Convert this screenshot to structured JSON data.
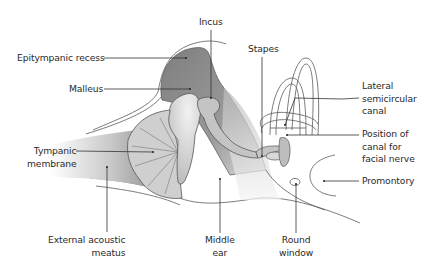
{
  "diagram": {
    "labels": {
      "incus": "Incus",
      "epitympanic_recess": "Epitympanic recess",
      "stapes": "Stapes",
      "malleus": "Malleus",
      "lateral_semicircular_canal": [
        "Lateral",
        "semicircular",
        "canal"
      ],
      "facial_nerve_canal": [
        "Position of",
        "canal for",
        "facial nerve"
      ],
      "tympanic_membrane": [
        "Tympanic",
        "membrane"
      ],
      "promontory": "Promontory",
      "external_acoustic_meatus": [
        "External acoustic",
        "meatus"
      ],
      "middle_ear": [
        "Middle",
        "ear"
      ],
      "round_window": [
        "Round",
        "window"
      ]
    },
    "colors": {
      "outline": "#4a4a4a",
      "leader": "#333333",
      "dark_fill": "#8a8a8a",
      "mid_fill": "#b5b5b5",
      "light_fill": "#d4d4d4",
      "text": "#2a2a2a"
    }
  }
}
